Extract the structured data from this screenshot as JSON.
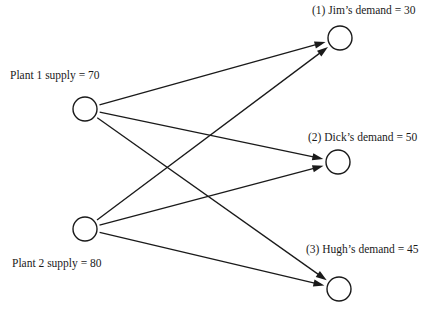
{
  "diagram": {
    "type": "transportation-network",
    "colors": {
      "ink": "#1a1a1a",
      "background": "#ffffff"
    },
    "sources": [
      {
        "id": "plant1",
        "label": "Plant 1 supply = 70",
        "name": "Plant 1",
        "supply": 70
      },
      {
        "id": "plant2",
        "label": "Plant 2 supply = 80",
        "name": "Plant 2",
        "supply": 80
      }
    ],
    "sinks": [
      {
        "id": "jim",
        "label": "(1) Jim’s demand = 30",
        "name": "Jim",
        "index": 1,
        "demand": 30
      },
      {
        "id": "dick",
        "label": "(2) Dick’s demand = 50",
        "name": "Dick",
        "index": 2,
        "demand": 50
      },
      {
        "id": "hugh",
        "label": "(3) Hugh’s demand = 45",
        "name": "Hugh",
        "index": 3,
        "demand": 45
      }
    ],
    "edges": [
      {
        "from": "plant1",
        "to": "jim"
      },
      {
        "from": "plant1",
        "to": "dick"
      },
      {
        "from": "plant1",
        "to": "hugh"
      },
      {
        "from": "plant2",
        "to": "jim"
      },
      {
        "from": "plant2",
        "to": "dick"
      },
      {
        "from": "plant2",
        "to": "hugh"
      }
    ]
  }
}
